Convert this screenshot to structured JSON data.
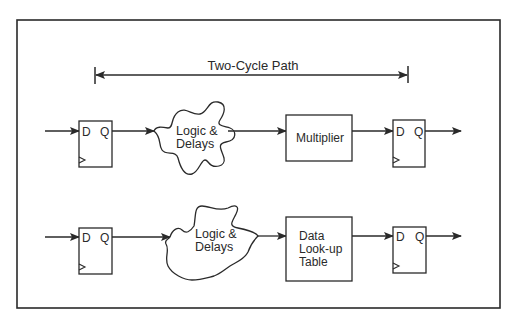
{
  "diagram": {
    "title": "Two-Cycle Path",
    "colors": {
      "stroke": "#2a2a2a",
      "background": "#ffffff"
    },
    "rows": [
      {
        "input_ff": {
          "d": "D",
          "q": "Q"
        },
        "cloud": {
          "line1": "Logic &",
          "line2": "Delays"
        },
        "block": {
          "lines": [
            "Multiplier"
          ]
        },
        "output_ff": {
          "d": "D",
          "q": "Q"
        }
      },
      {
        "input_ff": {
          "d": "D",
          "q": "Q"
        },
        "cloud": {
          "line1": "Logic &",
          "line2": "Delays"
        },
        "block": {
          "lines": [
            "Data",
            "Look-up",
            "Table"
          ]
        },
        "output_ff": {
          "d": "D",
          "q": "Q"
        }
      }
    ]
  }
}
